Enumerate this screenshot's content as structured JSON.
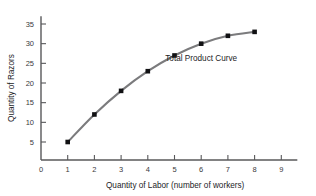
{
  "chart_data": {
    "type": "line",
    "title": "",
    "subtitle": "",
    "xlabel": "Quantity of Labor (number of workers)",
    "ylabel": "Quantity of Razors",
    "x": [
      1,
      2,
      3,
      4,
      5,
      6,
      7,
      8
    ],
    "values": [
      5,
      12,
      18,
      23,
      27,
      30,
      32,
      33
    ],
    "series": [
      {
        "name": "Total Product Curve",
        "x": [
          1,
          2,
          3,
          4,
          5,
          6,
          7,
          8
        ],
        "values": [
          5,
          12,
          18,
          23,
          27,
          30,
          32,
          33
        ]
      }
    ],
    "xlim": [
      0,
      9.6
    ],
    "ylim": [
      0,
      37
    ],
    "xticks": [
      0,
      1,
      2,
      3,
      4,
      5,
      6,
      7,
      8,
      9
    ],
    "xticklabels": [
      "0",
      "1",
      "2",
      "3",
      "4",
      "5",
      "6",
      "7",
      "8",
      "9"
    ],
    "yticks": [
      5,
      10,
      15,
      20,
      25,
      30,
      35
    ],
    "yticklabels": [
      "5",
      "10",
      "15",
      "20",
      "25",
      "30",
      "35"
    ],
    "grid": false,
    "legend": "none",
    "annotations": [
      {
        "text": "Total Product Curve",
        "x": 6.0,
        "y": 25.5
      }
    ],
    "colors": {
      "line": "#7b7b7d",
      "marker": "#111113",
      "axis": "#58585a",
      "text": "#1d1d1f",
      "background": "#ffffff"
    },
    "marker_style": "square"
  }
}
